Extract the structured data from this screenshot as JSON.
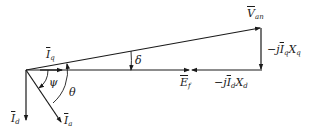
{
  "diagram": {
    "stroke_color": "#1a1a1a",
    "labels": {
      "V_an": {
        "main": "V",
        "sub": "an"
      },
      "I_q": {
        "main": "I",
        "sub": "q"
      },
      "I_d": {
        "main": "I",
        "sub": "d"
      },
      "I_a": {
        "main": "I",
        "sub": "a"
      },
      "E_f": {
        "main": "E",
        "sub": "f"
      },
      "jIqXq": {
        "prefix": "−j",
        "main": "I",
        "sub": "q",
        "suffix": "X",
        "suffix_sub": "q"
      },
      "jIdXd": {
        "prefix": "−j",
        "main": "I",
        "sub": "d",
        "suffix": "X",
        "suffix_sub": "d"
      },
      "delta": "δ",
      "psi": "ψ",
      "theta": "θ"
    },
    "points": {
      "origin": [
        26,
        70
      ],
      "V_an_tip": [
        261,
        27
      ],
      "E_f_tip": [
        188,
        70
      ],
      "jIdXd_start": [
        262,
        70
      ],
      "I_d_tip": [
        26,
        120
      ],
      "I_a_tip": [
        62,
        122
      ],
      "I_q_tip": [
        62,
        70
      ]
    }
  }
}
